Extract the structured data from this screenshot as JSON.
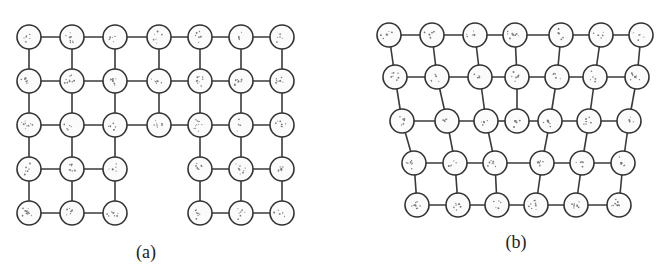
{
  "figure": {
    "panels": [
      {
        "id": "a",
        "label": "(a)",
        "label_pos": [
          146,
          258
        ],
        "description": "Square lattice with a missing-atom vacancy region at the bottom center",
        "node_radius": 12,
        "rows": [
          {
            "y": 37,
            "xs": [
              29,
              72,
              115,
              159,
              200,
              241,
              282
            ]
          },
          {
            "y": 81,
            "xs": [
              29,
              72,
              115,
              159,
              200,
              241,
              282
            ]
          },
          {
            "y": 125,
            "xs": [
              29,
              72,
              115,
              159,
              200,
              241,
              282
            ]
          },
          {
            "y": 169,
            "xs": [
              29,
              72,
              115,
              null,
              200,
              241,
              282
            ]
          },
          {
            "y": 213,
            "xs": [
              29,
              72,
              115,
              null,
              200,
              241,
              282
            ]
          }
        ]
      },
      {
        "id": "b",
        "label": "(b)",
        "label_pos": [
          516,
          248
        ],
        "description": "Relaxed lattice after vacancy collapse (edge dislocation)",
        "node_radius": 12,
        "rows": [
          {
            "y": 35,
            "xs": [
              389,
              432,
              475,
              515,
              561,
              601,
              641
            ]
          },
          {
            "y": 77,
            "xs": [
              395,
              437,
              480,
              517,
              557,
              595,
              637
            ]
          },
          {
            "y": 121,
            "xs": [
              402,
              447,
              486,
              517,
              550,
              589,
              629
            ]
          },
          {
            "y": 163,
            "xs": [
              414,
              455,
              495,
              542,
              582,
              623
            ]
          },
          {
            "y": 205,
            "xs": [
              417,
              458,
              497,
              536,
              576,
              619
            ]
          }
        ],
        "vertical_links": [
          [
            [
              0,
              0
            ],
            [
              1,
              0
            ]
          ],
          [
            [
              0,
              1
            ],
            [
              1,
              1
            ]
          ],
          [
            [
              0,
              2
            ],
            [
              1,
              2
            ]
          ],
          [
            [
              0,
              3
            ],
            [
              1,
              3
            ]
          ],
          [
            [
              0,
              4
            ],
            [
              1,
              4
            ]
          ],
          [
            [
              0,
              5
            ],
            [
              1,
              5
            ]
          ],
          [
            [
              0,
              6
            ],
            [
              1,
              6
            ]
          ],
          [
            [
              1,
              0
            ],
            [
              2,
              0
            ]
          ],
          [
            [
              1,
              1
            ],
            [
              2,
              1
            ]
          ],
          [
            [
              1,
              2
            ],
            [
              2,
              2
            ]
          ],
          [
            [
              1,
              3
            ],
            [
              2,
              3
            ]
          ],
          [
            [
              1,
              4
            ],
            [
              2,
              4
            ]
          ],
          [
            [
              1,
              5
            ],
            [
              2,
              5
            ]
          ],
          [
            [
              1,
              6
            ],
            [
              2,
              6
            ]
          ],
          [
            [
              2,
              0
            ],
            [
              3,
              0
            ]
          ],
          [
            [
              2,
              1
            ],
            [
              3,
              1
            ]
          ],
          [
            [
              2,
              2
            ],
            [
              3,
              2
            ]
          ],
          [
            [
              2,
              4
            ],
            [
              3,
              3
            ]
          ],
          [
            [
              2,
              5
            ],
            [
              3,
              4
            ]
          ],
          [
            [
              2,
              6
            ],
            [
              3,
              5
            ]
          ],
          [
            [
              3,
              0
            ],
            [
              4,
              0
            ]
          ],
          [
            [
              3,
              1
            ],
            [
              4,
              1
            ]
          ],
          [
            [
              3,
              2
            ],
            [
              4,
              2
            ]
          ],
          [
            [
              3,
              3
            ],
            [
              4,
              3
            ]
          ],
          [
            [
              3,
              4
            ],
            [
              4,
              4
            ]
          ],
          [
            [
              3,
              5
            ],
            [
              4,
              5
            ]
          ]
        ]
      }
    ]
  }
}
